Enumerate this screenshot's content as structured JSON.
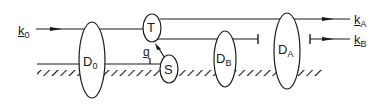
{
  "diagram": {
    "colors": {
      "stroke": "#1a1a1a",
      "background": "#ffffff"
    },
    "beams": {
      "input": {
        "symbol": "k",
        "subscript": "0"
      },
      "output_a": {
        "symbol": "k",
        "subscript": "A"
      },
      "output_b": {
        "symbol": "k",
        "subscript": "B"
      }
    },
    "nodes": {
      "d0": {
        "letter": "D",
        "subscript": "0"
      },
      "t": {
        "letter": "T"
      },
      "s": {
        "letter": "S"
      },
      "db": {
        "letter": "D",
        "subscript": "B"
      },
      "da": {
        "letter": "D",
        "subscript": "A"
      }
    },
    "annotations": {
      "q": {
        "letter": "q"
      }
    }
  }
}
